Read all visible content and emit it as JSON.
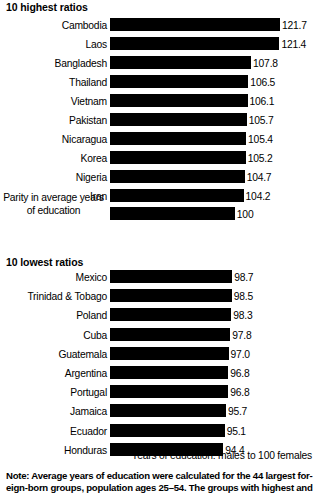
{
  "sections": {
    "highest_heading": "10 highest ratios",
    "lowest_heading": "10 lowest ratios"
  },
  "axis_caption": "Years of education: males to 100 females",
  "note": {
    "line1": "Note: Average years of education were calculated for the 44 largest for-",
    "line2": "eign-born groups, population ages 25–54. The groups with highest and"
  },
  "parity": {
    "label": "Parity in average years of education",
    "value": "100"
  },
  "highest": [
    {
      "label": "Cambodia",
      "value": "121.7"
    },
    {
      "label": "Laos",
      "value": "121.4"
    },
    {
      "label": "Bangladesh",
      "value": "107.8"
    },
    {
      "label": "Thailand",
      "value": "106.5"
    },
    {
      "label": "Vietnam",
      "value": "106.1"
    },
    {
      "label": "Pakistan",
      "value": "105.7"
    },
    {
      "label": "Nicaragua",
      "value": "105.4"
    },
    {
      "label": "Korea",
      "value": "105.2"
    },
    {
      "label": "Nigeria",
      "value": "104.7"
    },
    {
      "label": "Iran",
      "value": "104.2"
    }
  ],
  "lowest": [
    {
      "label": "Mexico",
      "value": "98.7"
    },
    {
      "label": "Trinidad & Tobago",
      "value": "98.5"
    },
    {
      "label": "Poland",
      "value": "98.3"
    },
    {
      "label": "Cuba",
      "value": "97.8"
    },
    {
      "label": "Guatemala",
      "value": "97.0"
    },
    {
      "label": "Argentina",
      "value": "96.8"
    },
    {
      "label": "Portugal",
      "value": "96.8"
    },
    {
      "label": "Jamaica",
      "value": "95.7"
    },
    {
      "label": "Ecuador",
      "value": "95.1"
    },
    {
      "label": "Honduras",
      "value": "94.4"
    }
  ],
  "chart_data": {
    "type": "bar",
    "title": "Years of education: males to 100 females",
    "orientation": "horizontal",
    "xlabel": "Years of education: males to 100 females",
    "ylabel": "",
    "grid": false,
    "legend": null,
    "bar_color": "#000000",
    "value_label_precision": 1,
    "axis_baseline_value": 40,
    "xlim": [
      40,
      133
    ],
    "groups": [
      {
        "name": "10 highest ratios",
        "categories": [
          "Cambodia",
          "Laos",
          "Bangladesh",
          "Thailand",
          "Vietnam",
          "Pakistan",
          "Nicaragua",
          "Korea",
          "Nigeria",
          "Iran"
        ],
        "values": [
          121.7,
          121.4,
          107.8,
          106.5,
          106.1,
          105.7,
          105.4,
          105.2,
          104.7,
          104.2
        ]
      },
      {
        "name": "Parity",
        "categories": [
          "Parity in average years of education"
        ],
        "values": [
          100
        ]
      },
      {
        "name": "10 lowest ratios",
        "categories": [
          "Mexico",
          "Trinidad & Tobago",
          "Poland",
          "Cuba",
          "Guatemala",
          "Argentina",
          "Portugal",
          "Jamaica",
          "Ecuador",
          "Honduras"
        ],
        "values": [
          98.7,
          98.5,
          98.3,
          97.8,
          97.0,
          96.8,
          96.8,
          95.7,
          95.1,
          94.4
        ]
      }
    ],
    "annotations": [
      "Note: Average years of education were calculated for the 44 largest for-",
      "eign-born groups, population ages 25–54. The groups with highest and"
    ]
  }
}
